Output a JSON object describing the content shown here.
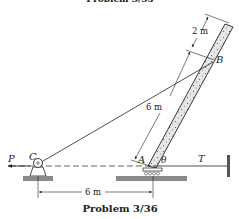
{
  "figure": {
    "top_caption_cropped": "Problem 3/35",
    "caption": "Problem 3/36",
    "labels": {
      "point_a": "A",
      "point_b": "B",
      "point_c": "C",
      "force_p": "P",
      "tension_t": "T",
      "angle": "θ"
    },
    "dimensions": {
      "beam_upper": "2 m",
      "beam_lower": "6 m",
      "horizontal": "6 m"
    },
    "colors": {
      "ink": "#222222",
      "ground": "#8a8a8a",
      "beam_fill": "#d9d9d9"
    }
  }
}
